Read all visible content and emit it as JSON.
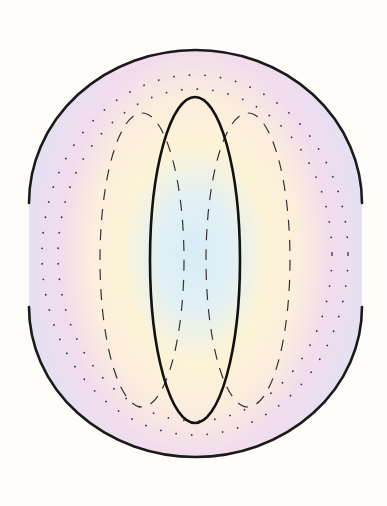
{
  "diagram": {
    "title": "",
    "colors": {
      "background": "#fefdf9",
      "core": "#d9ecf6",
      "middle_ring": "#fdf2d6",
      "outer_ring": "#f1dcec",
      "edge": "#e3e0f2",
      "stroke": "#1a1a1a"
    },
    "shapes": {
      "outer_boundary": {
        "cx": 195.5,
        "top_y": 50,
        "bottom_y": 457,
        "left_x": 29,
        "right_x": 362,
        "gap_top_y": 203,
        "gap_bottom_y": 307
      },
      "inner_ellipse": {
        "cx": 195,
        "cy": 260,
        "rx": 45,
        "ry": 163
      },
      "dashed_loops": [
        {
          "cx": 142,
          "cy": 260,
          "rx": 42,
          "ry": 147
        },
        {
          "cx": 248,
          "cy": 260,
          "rx": 42,
          "ry": 147
        }
      ],
      "dotted_contours": [
        {
          "cx": 195,
          "cy": 253,
          "rx": 155,
          "ry": 181
        },
        {
          "cx": 195,
          "cy": 253,
          "rx": 140,
          "ry": 168
        }
      ]
    }
  }
}
